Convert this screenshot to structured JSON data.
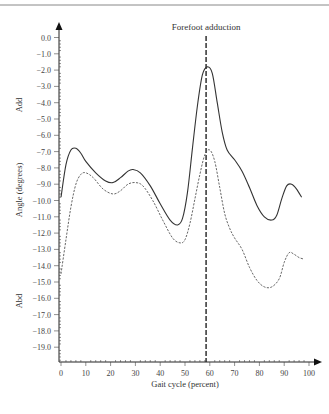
{
  "chart_data": {
    "type": "line",
    "title": "",
    "annotation": {
      "text": "Forefoot adduction",
      "x": 58.5
    },
    "xlabel": "Gait cycle (percent)",
    "ylabel": "Angle (degrees)",
    "ylabel_top": "Add",
    "ylabel_bottom": "Abd",
    "xlim": [
      0,
      100
    ],
    "ylim": [
      -20,
      0.5
    ],
    "x_ticks": [
      0,
      10,
      20,
      30,
      40,
      50,
      60,
      70,
      80,
      90,
      100
    ],
    "y_ticks": [
      "0.0",
      "-1.0",
      "-2.0",
      "-3.0",
      "-4.0",
      "-5.0",
      "-6.0",
      "-7.0",
      "-8.0",
      "-9.0",
      "-10.0",
      "-11.0",
      "-12.0",
      "-13.0",
      "-14.0",
      "-15.0",
      "-16.0",
      "-17.0",
      "-18.0",
      "-19.0"
    ],
    "grid": false,
    "legend": null,
    "series": [
      {
        "name": "solid",
        "style": "solid",
        "color": "#333333",
        "x": [
          0,
          2,
          4,
          6,
          8,
          10,
          14,
          18,
          21,
          24,
          27,
          29,
          32,
          36,
          40,
          44,
          47,
          49,
          51,
          53,
          55,
          57,
          59,
          61,
          63,
          65,
          67,
          70,
          73,
          76,
          79,
          82,
          85,
          87,
          89,
          91,
          93,
          95,
          97
        ],
        "y": [
          -9.8,
          -7.8,
          -6.9,
          -6.8,
          -7.1,
          -7.6,
          -8.3,
          -8.8,
          -8.9,
          -8.6,
          -8.2,
          -8.1,
          -8.3,
          -9.1,
          -10.2,
          -11.2,
          -11.5,
          -11.1,
          -9.5,
          -6.8,
          -4.2,
          -2.3,
          -1.8,
          -2.2,
          -4.0,
          -5.8,
          -6.9,
          -7.5,
          -8.2,
          -9.2,
          -10.3,
          -11.0,
          -11.2,
          -10.9,
          -9.9,
          -9.1,
          -9.0,
          -9.3,
          -9.8
        ]
      },
      {
        "name": "dashed",
        "style": "dashed",
        "color": "#555555",
        "x": [
          0,
          2,
          4,
          6,
          8,
          10,
          13,
          17,
          21,
          24,
          27,
          30,
          33,
          37,
          41,
          45,
          48,
          50,
          52,
          54,
          56,
          58,
          60,
          62,
          64,
          66,
          68,
          70,
          73,
          76,
          79,
          82,
          85,
          88,
          90,
          92,
          94,
          96,
          98
        ],
        "y": [
          -14.5,
          -12.4,
          -10.4,
          -9.0,
          -8.4,
          -8.3,
          -8.6,
          -9.3,
          -9.6,
          -9.4,
          -9.0,
          -8.9,
          -9.1,
          -10.0,
          -11.2,
          -12.3,
          -12.6,
          -12.4,
          -11.4,
          -9.9,
          -8.4,
          -7.2,
          -6.9,
          -7.6,
          -9.2,
          -10.8,
          -11.7,
          -12.3,
          -13.0,
          -14.1,
          -14.9,
          -15.3,
          -15.3,
          -14.8,
          -13.8,
          -13.2,
          -13.3,
          -13.5,
          -13.6
        ]
      }
    ]
  }
}
